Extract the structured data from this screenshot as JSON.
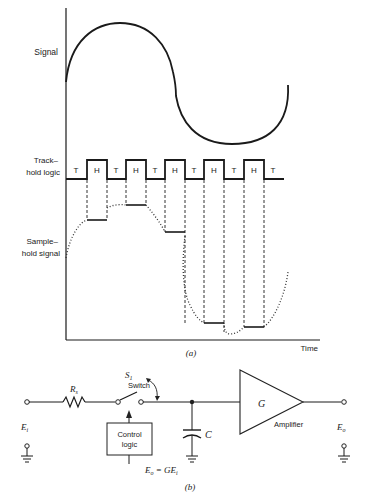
{
  "figure_a": {
    "caption": "(a)",
    "labels": {
      "signal": "Signal",
      "track_hold_line1": "Track–",
      "track_hold_line2": "hold logic",
      "sample_hold_line1": "Sample–",
      "sample_hold_line2": "hold signal",
      "time_axis": "Time"
    },
    "logic_states": [
      "T",
      "H",
      "T",
      "H",
      "T",
      "H",
      "T",
      "H",
      "T",
      "H",
      "T"
    ]
  },
  "figure_b": {
    "caption": "(b)",
    "labels": {
      "input": "E",
      "input_sub": "i",
      "resistor": "R",
      "resistor_sub": "s",
      "switch_symbol": "S",
      "switch_sub": "1",
      "switch": "Switch",
      "control_line1": "Control",
      "control_line2": "logic",
      "capacitor": "C",
      "amp_gain": "G",
      "amplifier": "Amplifier",
      "output": "E",
      "output_sub": "o",
      "equation_lhs": "E",
      "equation_lhs_sub": "o",
      "equation_rhs": " = GE",
      "equation_rhs_sub": "i"
    }
  }
}
